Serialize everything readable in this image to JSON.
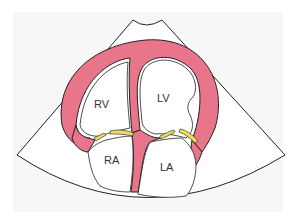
{
  "diagram": {
    "type": "apical four-chamber echocardiographic view",
    "labels": {
      "rv": "RV",
      "lv": "LV",
      "ra": "RA",
      "la": "LA"
    },
    "colors": {
      "background": "#f7f7f7",
      "sector_fill": "#ffffff",
      "outline": "#222222",
      "myocardium": "#e8758a",
      "valves": "#e8de5a"
    }
  }
}
